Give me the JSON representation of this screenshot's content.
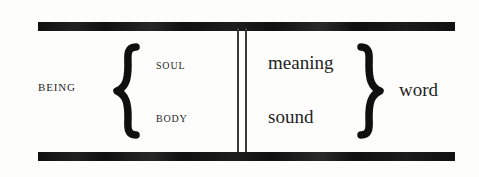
{
  "figure": {
    "background_color": "#fdfdfc",
    "ink_color": "#101010"
  },
  "left_group": {
    "label": "BEING",
    "brace": "left-curly-brace",
    "members": [
      {
        "label": "SOUL"
      },
      {
        "label": "BODY"
      }
    ]
  },
  "divider": {
    "style": "double-vertical-rule",
    "line_count": 2
  },
  "right_group": {
    "label": "word",
    "brace": "right-curly-brace",
    "members": [
      {
        "label": "meaning"
      },
      {
        "label": "sound"
      }
    ]
  },
  "rules": {
    "top": "horizontal-rule-top",
    "bottom": "horizontal-rule-bottom"
  }
}
